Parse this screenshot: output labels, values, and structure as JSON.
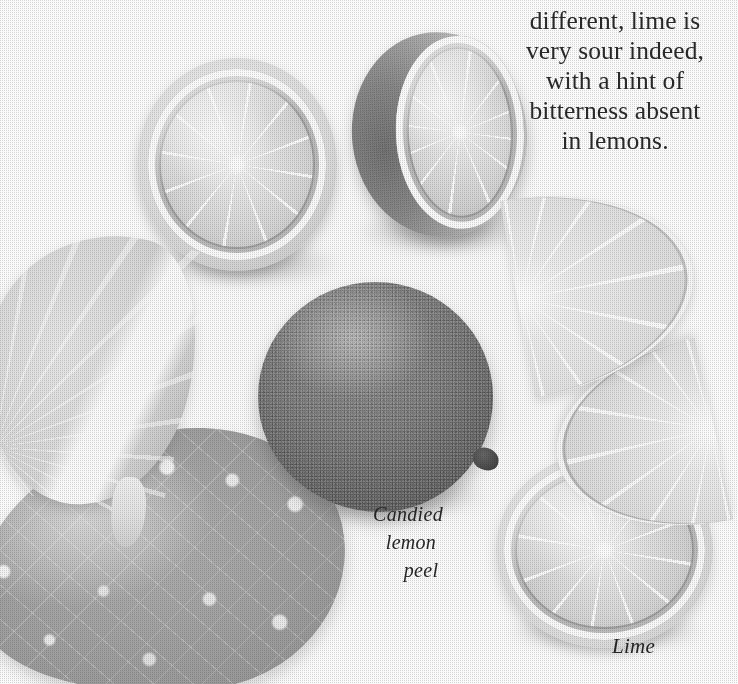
{
  "page": {
    "kind": "printed-cookbook-page-photograph",
    "background_color": "#ffffff",
    "ink_color": "#2a2a2c"
  },
  "body_copy": {
    "clipped_top_line": "p",
    "lines": [
      "different, lime is",
      "very sour indeed,",
      "with a hint of",
      "bitterness absent",
      "in lemons."
    ],
    "full_text": "different, lime is very sour indeed, with a hint of bitterness absent in lemons.",
    "alignment": "center"
  },
  "captions": [
    {
      "name": "candied-lemon-peel",
      "lines": [
        "Candied",
        "lemon",
        "peel"
      ],
      "full_text": "Candied lemon peel",
      "style": "italic-script"
    },
    {
      "name": "lime",
      "lines": [
        "Lime"
      ],
      "full_text": "Lime",
      "style": "italic-script"
    }
  ],
  "subjects": [
    {
      "name": "lime-half-left",
      "label": "lime half, cut face up"
    },
    {
      "name": "lime-half-right",
      "label": "lime half, angled rind showing"
    },
    {
      "name": "whole-lime",
      "label": "whole lime"
    },
    {
      "name": "lemon-wedge",
      "label": "lemon wedge"
    },
    {
      "name": "candied-peel",
      "label": "candied lemon peel"
    },
    {
      "name": "lime-slice-a",
      "label": "lime half-moon slice, upper"
    },
    {
      "name": "lime-slice-b",
      "label": "lime half-moon slice, lower"
    },
    {
      "name": "lime-round",
      "label": "round lime slice"
    }
  ],
  "palette": {
    "paper": "#ffffff",
    "flesh_light": "#f0f0ec",
    "flesh_mid": "#dcdcd6",
    "rind_mid": "#8d8d85",
    "rind_dark": "#3c3a36",
    "peel_gray": "#a3a39a",
    "text": "#2a2a2c"
  }
}
